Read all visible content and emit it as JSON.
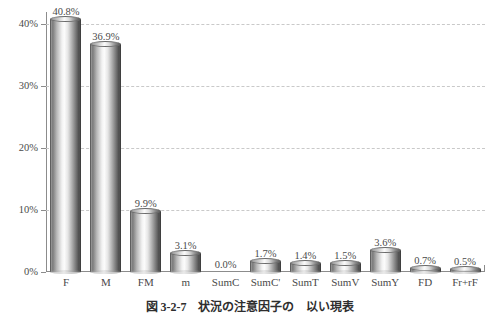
{
  "chart_data": {
    "type": "bar",
    "title": "",
    "subtitle": "",
    "xlabel": "",
    "ylabel": "",
    "categories": [
      "F",
      "M",
      "FM",
      "m",
      "SumC",
      "SumC'",
      "SumT",
      "SumV",
      "SumY",
      "FD",
      "Fr+rF"
    ],
    "values": [
      40.8,
      36.9,
      9.9,
      3.1,
      0.0,
      1.7,
      1.4,
      1.5,
      3.6,
      0.7,
      0.5
    ],
    "value_labels": [
      "40.8%",
      "36.9%",
      "9.9%",
      "3.1%",
      "0.0%",
      "1.7%",
      "1.4%",
      "1.5%",
      "3.6%",
      "0.7%",
      "0.5%"
    ],
    "ylim": [
      0,
      42
    ],
    "yticks": [
      0,
      10,
      20,
      30,
      40
    ],
    "ytick_labels": [
      "0%",
      "10%",
      "20%",
      "30%",
      "40%"
    ],
    "grid": true,
    "gridline_style": "dashed",
    "legend": null,
    "bar_style": "3d-cylinder",
    "colors": {
      "bar_light": "#fcfcfc",
      "bar_mid": "#b0b0b0",
      "bar_dark": "#4a4a4a",
      "gridline": "#c9c9c9",
      "axis": "#8c8c8c",
      "text": "#4a4a4a",
      "background": "#ffffff"
    }
  },
  "caption": {
    "text": "図 3-2-7　状況の注意因子の　以い現表"
  }
}
